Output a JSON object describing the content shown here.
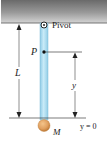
{
  "diagram": {
    "type": "physical-pendulum",
    "labels": {
      "pivot": "Pivot",
      "point": "P",
      "length": "L",
      "height": "y",
      "mass": "M",
      "origin": "y = 0"
    },
    "colors": {
      "ceiling_top": "#5a5a5a",
      "ceiling_bottom": "#c8c8c8",
      "rod_fill": "#b5dff0",
      "rod_edge": "#7fbcd8",
      "mass_fill": "#e0a060",
      "mass_edge": "#c07a35",
      "line": "#333333"
    }
  }
}
